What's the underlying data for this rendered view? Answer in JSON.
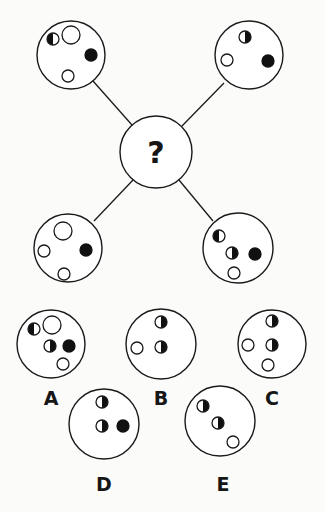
{
  "puzzle": {
    "center": {
      "symbol": "?",
      "cx": 156,
      "cy": 152,
      "r": 36
    },
    "outer": [
      {
        "id": "top-left",
        "cx": 71,
        "cy": 55,
        "r": 34,
        "line": [
          93,
          81,
          132,
          125
        ],
        "dots": [
          {
            "type": "half-left-black",
            "cx": 53,
            "cy": 39,
            "r": 6
          },
          {
            "type": "white",
            "cx": 71,
            "cy": 35,
            "r": 9
          },
          {
            "type": "black",
            "cx": 91,
            "cy": 55,
            "r": 6
          },
          {
            "type": "white",
            "cx": 68,
            "cy": 76,
            "r": 6
          }
        ]
      },
      {
        "id": "top-right",
        "cx": 249,
        "cy": 55,
        "r": 34,
        "line": [
          224,
          83,
          182,
          126
        ],
        "dots": [
          {
            "type": "half-right-black",
            "cx": 245,
            "cy": 37,
            "r": 6
          },
          {
            "type": "white",
            "cx": 227,
            "cy": 60,
            "r": 6
          },
          {
            "type": "black",
            "cx": 268,
            "cy": 61,
            "r": 6
          }
        ]
      },
      {
        "id": "bottom-left",
        "cx": 68,
        "cy": 248,
        "r": 34,
        "line": [
          94,
          221,
          133,
          180
        ],
        "dots": [
          {
            "type": "white",
            "cx": 63,
            "cy": 231,
            "r": 9
          },
          {
            "type": "white",
            "cx": 44,
            "cy": 251,
            "r": 6
          },
          {
            "type": "black",
            "cx": 86,
            "cy": 250,
            "r": 6
          },
          {
            "type": "white",
            "cx": 64,
            "cy": 274,
            "r": 6
          }
        ]
      },
      {
        "id": "bottom-right",
        "cx": 238,
        "cy": 248,
        "r": 35,
        "line": [
          213,
          221,
          179,
          180
        ],
        "dots": [
          {
            "type": "half-left-black",
            "cx": 219,
            "cy": 236,
            "r": 6
          },
          {
            "type": "half-right-black",
            "cx": 232,
            "cy": 253,
            "r": 6
          },
          {
            "type": "black",
            "cx": 255,
            "cy": 254,
            "r": 6
          },
          {
            "type": "white",
            "cx": 234,
            "cy": 273,
            "r": 6
          }
        ]
      }
    ]
  },
  "options": [
    {
      "label": "A",
      "cx": 51,
      "cy": 344,
      "r": 34,
      "lx": 51,
      "ly": 405,
      "dots": [
        {
          "type": "half-left-black",
          "cx": 34,
          "cy": 329,
          "r": 6
        },
        {
          "type": "white",
          "cx": 52,
          "cy": 325,
          "r": 9
        },
        {
          "type": "half-right-black",
          "cx": 50,
          "cy": 346,
          "r": 6
        },
        {
          "type": "black",
          "cx": 69,
          "cy": 346,
          "r": 6
        },
        {
          "type": "white",
          "cx": 63,
          "cy": 364,
          "r": 6
        }
      ]
    },
    {
      "label": "B",
      "cx": 161,
      "cy": 344,
      "r": 35,
      "lx": 161,
      "ly": 405,
      "dots": [
        {
          "type": "half-right-black",
          "cx": 161,
          "cy": 322,
          "r": 6
        },
        {
          "type": "white",
          "cx": 137,
          "cy": 348,
          "r": 6
        },
        {
          "type": "half-right-black",
          "cx": 161,
          "cy": 347,
          "r": 6
        }
      ]
    },
    {
      "label": "C",
      "cx": 272,
      "cy": 344,
      "r": 34,
      "lx": 272,
      "ly": 405,
      "dots": [
        {
          "type": "half-right-black",
          "cx": 272,
          "cy": 321,
          "r": 6
        },
        {
          "type": "white",
          "cx": 248,
          "cy": 345,
          "r": 6
        },
        {
          "type": "half-right-black",
          "cx": 272,
          "cy": 345,
          "r": 6
        },
        {
          "type": "white",
          "cx": 268,
          "cy": 365,
          "r": 6
        }
      ]
    },
    {
      "label": "D",
      "cx": 104,
      "cy": 424,
      "r": 35,
      "lx": 104,
      "ly": 491,
      "dots": [
        {
          "type": "half-right-black",
          "cx": 102,
          "cy": 402,
          "r": 6
        },
        {
          "type": "half-right-black",
          "cx": 102,
          "cy": 426,
          "r": 6
        },
        {
          "type": "black",
          "cx": 123,
          "cy": 426,
          "r": 6
        }
      ]
    },
    {
      "label": "E",
      "cx": 220,
      "cy": 421,
      "r": 35,
      "lx": 223,
      "ly": 491,
      "dots": [
        {
          "type": "half-right-black",
          "cx": 203,
          "cy": 406,
          "r": 6
        },
        {
          "type": "half-right-black",
          "cx": 218,
          "cy": 423,
          "r": 6
        },
        {
          "type": "white",
          "cx": 233,
          "cy": 442,
          "r": 6
        }
      ]
    }
  ]
}
